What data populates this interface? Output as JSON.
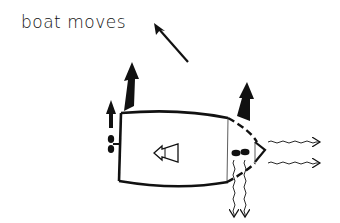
{
  "diagram": {
    "caption": "boat moves",
    "caption_arrow_direction": "up-left",
    "elements": [
      {
        "name": "boat-hull",
        "description": "boat hull seen from above, stern on left, bow on right"
      },
      {
        "name": "bow-section",
        "description": "dashed bow section with thruster"
      },
      {
        "name": "stern-propeller",
        "description": "propeller at stern"
      },
      {
        "name": "bow-thruster",
        "description": "bow thruster propeller"
      },
      {
        "name": "stern-thrust-arrow",
        "description": "large black arrow up at stern"
      },
      {
        "name": "small-stern-arrow",
        "description": "small black arrow up beside stern propeller"
      },
      {
        "name": "bow-thrust-arrow",
        "description": "large black arrow up at bow"
      },
      {
        "name": "direction-indicator",
        "description": "hollow arrow pointing left inside hull"
      },
      {
        "name": "water-jets-right",
        "description": "two wavy arrows pointing right from bow"
      },
      {
        "name": "water-jets-down",
        "description": "two wavy arrows pointing down from bow thruster"
      }
    ],
    "colors": {
      "ink": "#111111",
      "background": "#ffffff"
    }
  }
}
